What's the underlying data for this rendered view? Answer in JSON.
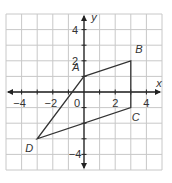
{
  "diagram": {
    "type": "coordinate-plane",
    "x_range": [
      -5,
      5
    ],
    "y_range": [
      -5,
      5
    ],
    "axis_labels": {
      "x": "x",
      "y": "y"
    },
    "x_ticks": [
      {
        "value": -4,
        "label": "−4"
      },
      {
        "value": -2,
        "label": "−2"
      },
      {
        "value": 2,
        "label": "2"
      },
      {
        "value": 4,
        "label": "4"
      }
    ],
    "y_ticks": [
      {
        "value": 4,
        "label": "4"
      },
      {
        "value": 2,
        "label": "2"
      },
      {
        "value": -4,
        "label": "−4"
      }
    ],
    "origin_label": "0",
    "points": [
      {
        "name": "A",
        "x": 0,
        "y": 1
      },
      {
        "name": "B",
        "x": 3,
        "y": 2
      },
      {
        "name": "C",
        "x": 3,
        "y": -1
      },
      {
        "name": "D",
        "x": -3,
        "y": -3
      }
    ],
    "polygon": [
      "A",
      "B",
      "C",
      "D"
    ],
    "colors": {
      "grid": "#c8c8c8",
      "axis": "#222222",
      "shape": "#333333"
    }
  }
}
